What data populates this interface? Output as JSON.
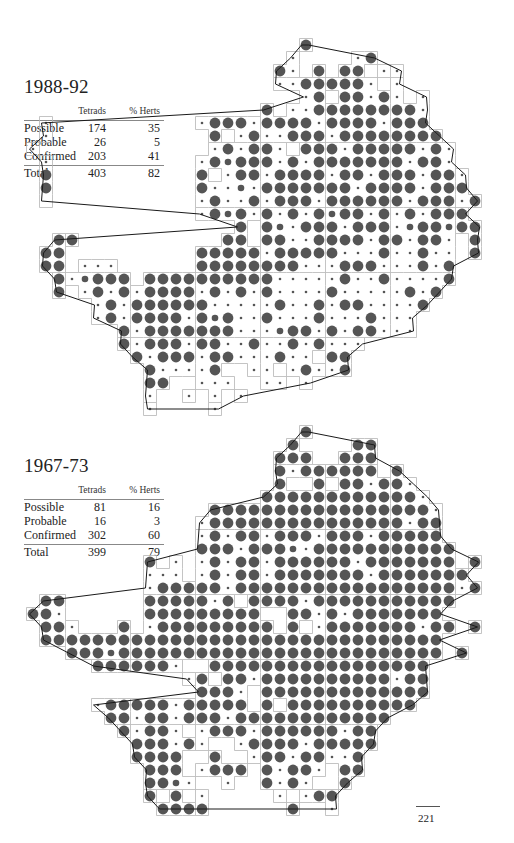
{
  "periods": [
    {
      "title": "1988-92",
      "table": {
        "columns": [
          "",
          "Tetrads",
          "% Herts"
        ],
        "rows": [
          {
            "label": "Possible",
            "tetrads": "174",
            "pct": "35"
          },
          {
            "label": "Probable",
            "tetrads": "26",
            "pct": "5"
          },
          {
            "label": "Confirmed",
            "tetrads": "203",
            "pct": "41"
          }
        ],
        "total": {
          "label": "Total",
          "tetrads": "403",
          "pct": "82"
        }
      },
      "map": {
        "origin_y": 45,
        "rows": [
          "                      L             ",
          "                     s    sL        ",
          "                    Ls L LL ss      ",
          "                    ssLLLLLs s      ",
          "                      sL LLsLs s    ",
          "                   L ssLLLLLLLLs    ",
          "  s           sLLLsLLLLsLLLLsLLL    ",
          "  s            L sLssLLLsLLLLLLLL   ",
          " s             sLsLLs LLLsLLLLLsLs  ",
          "  s           sLMLLLsLsLLLLLLLsLLs  ",
          "  L           L sLLsLLLLsLLsLLLsLLs ",
          "  L           LssMsLLLLLLLsLLLLsLLL ",
          "  .           sLssLsLLLsLLLLLLsLLLsL",
          "              sLMLsLsLsLMLLsLsLsLLL ",
          "                 L LMsLLLsLLLsMLLMLL",
          "   LL           LL LLssLLLLsLLsLLs L",
          "  LL          LLLLLsLLLLLsssLssLss L",
          "  LL sss      LLLLLLLLsssLLLsssLsL  ",
          "   LsMLLL LLLLLLLLLLsssssLssLssssL  ",
          "   L sLsLsLLLLsLsLsLssssLsssssLsL   ",
          "      sLsLLLLLLsssssLssLsLLssssL    ",
          "      sLsLLLLsLMLssLsssLsssLsss     ",
          "        LsLLLLLLLsssMLLsLsLLsss     ",
          "        LsLLLsLLssLssLsLsss         ",
          "         LsLLLsLLsssLss LL          ",
          "          LssssL  ss sLssL          ",
          "          LL  sss  ss s             ",
          "          s  s s s                  ",
          "          s    s                    "
        ]
      }
    },
    {
      "title": "1967-73",
      "table": {
        "columns": [
          "",
          "Tetrads",
          "% Herts"
        ],
        "rows": [
          {
            "label": "Possible",
            "tetrads": "81",
            "pct": "16"
          },
          {
            "label": "Probable",
            "tetrads": "16",
            "pct": "3"
          },
          {
            "label": "Confirmed",
            "tetrads": "302",
            "pct": "60"
          }
        ],
        "total": {
          "label": "Total",
          "tetrads": "399",
          "pct": "79"
        }
      },
      "map": {
        "origin_y": 432,
        "rows": [
          "                      L             ",
          "                     L    LL        ",
          "                    LLL  LLL        ",
          "                    LsLLLLLL L      ",
          "                    L  L LLsLLs     ",
          "                   LLLLLLLLLLLLs    ",
          "               LLLLLLLLLLLLLLLLLs   ",
          "              sLLLLLLLLLLLLLLLsLL   ",
          "              sLsLLsLLLsLLLsLLLLL   ",
          "              LLLsLLLMsLLLLLLLLLLL  ",
          "          L s sLsLLsLLLLLLsLLLLLLL L",
          "          sss sLsLLsLLLLLLLsLLLLLLL ",
          "          sLLLLLsLLLLLLLLLLLLLLLLLsL",
          "  LL      LLLLLsL LLLLsLLLLLLLLLLL  ",
          " LLs      LLLLLLLLL  LLsLsLLLLLLL   ",
          "  LLs   L sLLLLLLLLL L sLLLLLLLsLL L",
          "  LLLLLLLLLLLLLLLLLLLLLLLLLLLLLLL   ",
          "    LLLMLLLLLLLLLLLLLLLLLLLLLLLLL L ",
          "      LLLLLLs  LLLLLLLLLLLLLLLLL    ",
          "             sL LLsLLLLLLLLLLsLL    ",
          "              LLLs LLLLLLLLLLLLL    ",
          "      sLLLLLsLLLLL L LLLLLLLLLL     ",
          "       LLsLLsLLLsLLLLLLLLLLLL       ",
          "        LsLLs sLLLsLLLLLLsLL        ",
          "         LLLsLs  sLLLLsLLLLL        ",
          "         LLLL  L  sLLsLLssL         ",
          "          LLL sLLL LsLLs LL         ",
          "          LLMs  s  LsLs  L          ",
          "          L L s     s sLL           ",
          "           LLLL      L  s           "
        ]
      }
    }
  ],
  "legend_encoding": {
    "L": "confirmed (large dot)",
    "M": "probable (medium dot)",
    "s": "possible (small dot)",
    ".": "no record"
  },
  "colors": {
    "dot": "#555555",
    "grid": "#b5b5b5",
    "boundary": "#1a1a1a"
  },
  "page_number": "221"
}
